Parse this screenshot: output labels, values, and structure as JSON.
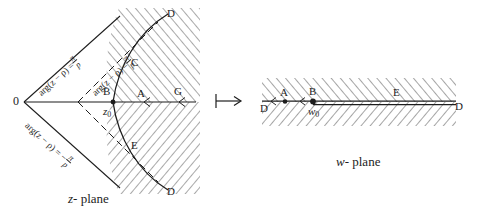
{
  "figure": {
    "type": "conformal-mapping-diagram",
    "ink_color": "#1d1d1d",
    "background": "#ffffff",
    "mapping_arrow": "→"
  },
  "z_plane": {
    "caption_var": "z",
    "caption_rest": "- plane",
    "origin_label": "0",
    "vertex_label": "B",
    "vertex_point_label": "z",
    "vertex_point_sub": "0",
    "ray_upper_label_head": "arg(z − ρ) =",
    "ray_upper_frac_num": "π",
    "ray_upper_frac_den": "p",
    "ray_inner_label_head": "arg(z − ρ) =",
    "ray_inner_frac_num": "π",
    "ray_inner_frac_den": "p",
    "ray_lower_label_head": "arg(z − ρ) = −",
    "ray_lower_frac_num": "π",
    "ray_lower_frac_den": "p",
    "curve_top_label": "D",
    "curve_bottom_label": "D",
    "curve_upper_mid_label": "C",
    "curve_lower_mid_label": "E",
    "axis_inner_label": "A",
    "axis_outer_label": "G"
  },
  "w_plane": {
    "caption_var": "w",
    "caption_rest": "- plane",
    "left_end_label": "D",
    "right_end_label": "D",
    "left_point_label": "A",
    "slit_point_label": "B",
    "slit_point_value": "w",
    "slit_point_sub": "0",
    "right_mid_label": "E"
  }
}
